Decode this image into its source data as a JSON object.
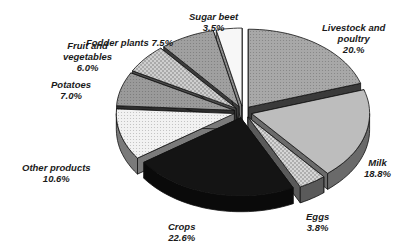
{
  "chart_data": {
    "type": "pie",
    "variant": "3d-exploded",
    "title": "",
    "categories": [
      "Livestock and poultry",
      "Milk",
      "Eggs",
      "Crops",
      "Other products",
      "Potatoes",
      "Fruit and vegetables",
      "Fodder plants",
      "Sugar beet"
    ],
    "values": [
      20.0,
      18.8,
      3.8,
      22.6,
      10.6,
      7.0,
      6.0,
      7.5,
      3.5
    ],
    "unit": "%",
    "labels": [
      {
        "name": "Livestock and poultry",
        "line1": "Livestock and",
        "line2": "poultry",
        "value": "20.%"
      },
      {
        "name": "Milk",
        "line1": "Milk",
        "line2": "",
        "value": "18.8%"
      },
      {
        "name": "Eggs",
        "line1": "Eggs",
        "line2": "",
        "value": "3.8%"
      },
      {
        "name": "Crops",
        "line1": "Crops",
        "line2": "",
        "value": "22.6%"
      },
      {
        "name": "Other products",
        "line1": "Other products",
        "line2": "",
        "value": "10.6%"
      },
      {
        "name": "Potatoes",
        "line1": "Potatoes",
        "line2": "",
        "value": "7.0%"
      },
      {
        "name": "Fruit and vegetables",
        "line1": "Fruit and",
        "line2": "vegetables",
        "value": "6.0%"
      },
      {
        "name": "Fodder plants",
        "line1": "Fodder plants 7.5%",
        "line2": "",
        "value": ""
      },
      {
        "name": "Sugar beet",
        "line1": "Sugar beet",
        "line2": "",
        "value": "3.5%"
      }
    ],
    "colors": {
      "Livestock and poultry": "#a8a8a8",
      "Milk": "#bdbdbd",
      "Eggs": "#d6d6d6",
      "Crops": "#141414",
      "Other products": "#f2f2f2",
      "Potatoes": "#9a9a9a",
      "Fruit and vegetables": "#cfcfcf",
      "Fodder plants": "#a0a0a0",
      "Sugar beet": "#f7f7f7"
    },
    "side_colors": {
      "Livestock and poultry": "#3a3a3a",
      "Milk": "#6a6a6a",
      "Eggs": "#5a5a5a",
      "Crops": "#0a0a0a",
      "Other products": "#7a7a7a",
      "Potatoes": "#2e2e2e",
      "Fruit and vegetables": "#4a4a4a",
      "Fodder plants": "#3c3c3c",
      "Sugar beet": "#888888"
    },
    "legend": "none (data labels on slices)"
  }
}
